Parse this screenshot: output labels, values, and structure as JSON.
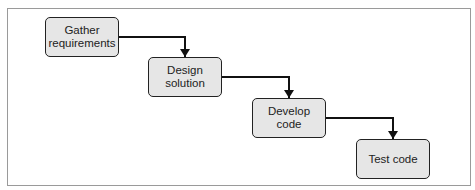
{
  "diagram": {
    "steps": [
      {
        "label": "Gather requirements",
        "line1": "Gather",
        "line2": "requirements"
      },
      {
        "label": "Design solution",
        "line1": "Design",
        "line2": "solution"
      },
      {
        "label": "Develop code",
        "line1": "Develop",
        "line2": "code"
      },
      {
        "label": "Test code",
        "line1": "Test code",
        "line2": ""
      }
    ],
    "edges": [
      {
        "from": "Gather requirements",
        "to": "Design solution"
      },
      {
        "from": "Design solution",
        "to": "Develop code"
      },
      {
        "from": "Develop code",
        "to": "Test code"
      }
    ],
    "box_fill": "#e6e6e6",
    "stroke": "#222222"
  }
}
